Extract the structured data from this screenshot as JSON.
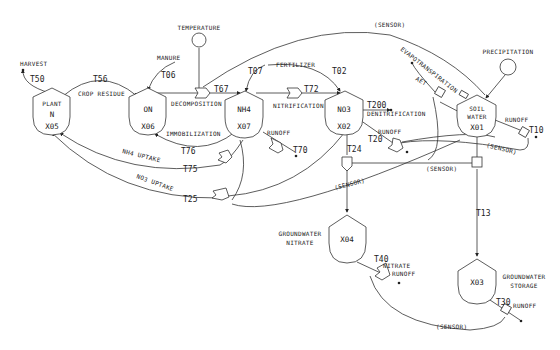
{
  "diagram": {
    "nodes": {
      "plant": {
        "line1": "PLANT",
        "line2": "N",
        "id": "X05"
      },
      "on": {
        "line1": "ON",
        "id": "X06"
      },
      "nh4": {
        "line1": "NH4",
        "id": "X07"
      },
      "no3": {
        "line1": "NO3",
        "id": "X02"
      },
      "soil": {
        "line1": "SOIL",
        "line2": "WATER",
        "id": "X01"
      },
      "gwn": {
        "id": "X04",
        "label1": "GROUNDWATER",
        "label2": "NITRATE"
      },
      "gws": {
        "id": "X03",
        "label1": "GROUNDWATER",
        "label2": "STORAGE"
      }
    },
    "sources": {
      "temperature": "TEMPERATURE",
      "precipitation": "PRECIPITATION",
      "harvest": "HARVEST",
      "manure": "MANURE",
      "fertilizer": "FERTILIZER"
    },
    "flows": {
      "crop_residue": "CROP RESIDUE",
      "decomposition": "DECOMPOSITION",
      "nitrification": "NITRIFICATION",
      "denitrification": "DENITRIFICATION",
      "immobilization": "IMMOBILIZATION",
      "nh4_uptake": "NH4 UPTAKE",
      "no3_uptake": "NO3 UPTAKE",
      "evapotranspiration": "EVAPOTRANSPIRATION",
      "aet": "AET",
      "runoff": "RUNOFF",
      "nitrate_runoff_1": "NITRATE",
      "nitrate_runoff_2": "RUNOFF",
      "sensor": "(SENSOR)"
    },
    "transfers": {
      "t50": "T50",
      "t56": "T56",
      "t06": "T06",
      "t67": "T67",
      "t07": "T07",
      "t02": "T02",
      "t72": "T72",
      "t200": "T200",
      "t76": "T76",
      "t70": "T70",
      "t75": "T75",
      "t25": "T25",
      "t20": "T20",
      "t24": "T24",
      "t10": "T10",
      "t13": "T13",
      "t40": "T40",
      "t30": "T30"
    }
  }
}
